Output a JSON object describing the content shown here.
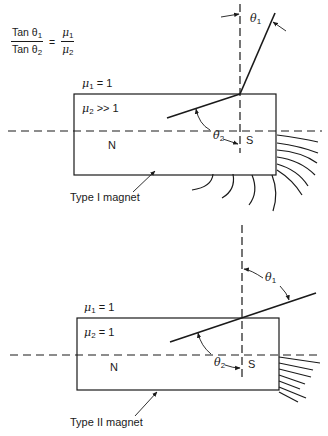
{
  "formula": {
    "numerator_left": "Tan θ",
    "numerator_left_sub": "1",
    "denominator_left": "Tan θ",
    "denominator_left_sub": "2",
    "equals": "=",
    "numerator_right": "μ",
    "numerator_right_sub": "1",
    "denominator_right": "μ",
    "denominator_right_sub": "2"
  },
  "magnets": [
    {
      "caption": "Type I magnet",
      "mu1_label": "μ",
      "mu1_sub": "1",
      "mu1_value": " = 1",
      "mu2_label": "μ",
      "mu2_sub": "2",
      "mu2_value": " >> 1",
      "north_label": "N",
      "south_label": "S",
      "theta1_label": "θ",
      "theta1_sub": "1",
      "theta2_label": "θ",
      "theta2_sub": "2"
    },
    {
      "caption": "Type II magnet",
      "mu1_label": "μ",
      "mu1_sub": "1",
      "mu1_value": " = 1",
      "mu2_label": "μ",
      "mu2_sub": "2",
      "mu2_value": " = 1",
      "north_label": "N",
      "south_label": "S",
      "theta1_label": "θ",
      "theta1_sub": "1",
      "theta2_label": "θ",
      "theta2_sub": "2"
    }
  ],
  "colors": {
    "ink": "#1a1a1a",
    "background": "#ffffff"
  }
}
